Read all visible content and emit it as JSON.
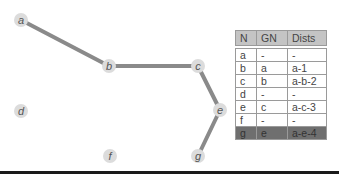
{
  "graph": {
    "nodes": [
      {
        "id": "a",
        "x": 21,
        "y": 20
      },
      {
        "id": "b",
        "x": 109,
        "y": 66
      },
      {
        "id": "c",
        "x": 198,
        "y": 66
      },
      {
        "id": "d",
        "x": 21,
        "y": 111
      },
      {
        "id": "e",
        "x": 220,
        "y": 110
      },
      {
        "id": "f",
        "x": 110,
        "y": 156
      },
      {
        "id": "g",
        "x": 198,
        "y": 156
      }
    ],
    "edges": [
      {
        "from": "a",
        "to": "b"
      },
      {
        "from": "b",
        "to": "c"
      },
      {
        "from": "c",
        "to": "e"
      },
      {
        "from": "e",
        "to": "g"
      }
    ]
  },
  "table": {
    "headers": [
      "N",
      "GN",
      "Dists"
    ],
    "rows": [
      [
        "a",
        "-",
        "-"
      ],
      [
        "b",
        "a",
        "a-1"
      ],
      [
        "c",
        "b",
        "a-b-2"
      ],
      [
        "d",
        "-",
        "-"
      ],
      [
        "e",
        "c",
        "a-c-3"
      ],
      [
        "f",
        "-",
        "-"
      ],
      [
        "g",
        "e",
        "a-e-4"
      ]
    ],
    "highlighted_row": 6
  },
  "colors": {
    "edge": "#8a8a8a",
    "node": "#dcdcdc",
    "header": "#c4c4c4",
    "highlight": "#6f6f6f"
  }
}
